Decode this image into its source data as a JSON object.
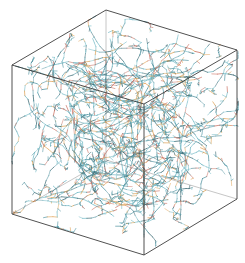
{
  "figure": {
    "colors": {
      "background": "#ffffff",
      "bond_primary": "#6fb8c4",
      "bond_secondary": "#4a8e9c",
      "bond_dark": "#2f5f6a",
      "accent_orange": "#e0a050",
      "accent_red": "#c86a5a",
      "box_edge": "#333333"
    },
    "box_vertices": {
      "back_top_left": [
        106,
        10
      ],
      "back_top_right": [
        237,
        50
      ],
      "front_top_left": [
        12,
        65
      ],
      "front_top_right": [
        144,
        104
      ],
      "front_bottom_left": [
        12,
        214
      ],
      "front_bottom_right": [
        144,
        255
      ],
      "back_bottom_right": [
        237,
        199
      ],
      "back_bottom_left": [
        106,
        160
      ]
    }
  }
}
